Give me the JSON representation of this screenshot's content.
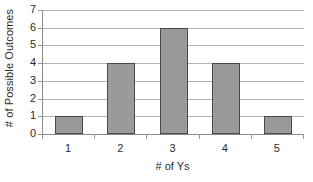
{
  "chart_data": {
    "type": "bar",
    "title": "",
    "xlabel": "# of Ys",
    "ylabel": "# of Possible Outcomes",
    "categories": [
      "1",
      "2",
      "3",
      "4",
      "5"
    ],
    "values": [
      1,
      4,
      6,
      4,
      1
    ],
    "ylim": [
      0,
      7
    ],
    "yticks": [
      0,
      1,
      2,
      3,
      4,
      5,
      6,
      7
    ],
    "ytick_labels": [
      "0",
      "1",
      "2",
      "3",
      "4",
      "5",
      "6",
      "7"
    ],
    "grid": true,
    "grid_axis": "y",
    "legend": false,
    "legend_position": "none",
    "series": [
      {
        "name": "# of Possible Outcomes",
        "values": [
          1,
          4,
          6,
          4,
          1
        ]
      }
    ],
    "colors": {
      "bar_fill": "#9a9a9a",
      "bar_border": "#4a4a4a",
      "gridline": "#b3b3b3",
      "axis_line": "#8a8a8a",
      "background": "#ffffff",
      "text": "#2b2b2b"
    }
  }
}
